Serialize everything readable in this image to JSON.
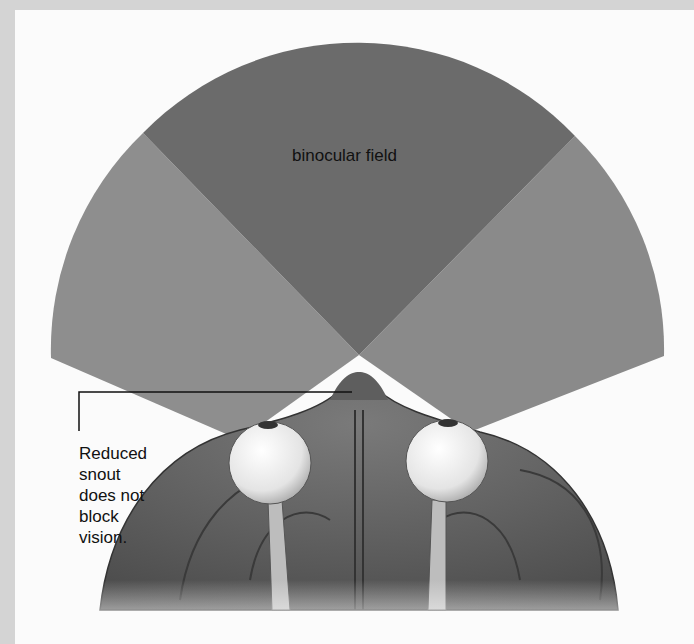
{
  "figure": {
    "binocular_label": "binocular field",
    "callout_lines": [
      "Reduced",
      "snout",
      "does not",
      "block",
      "vision."
    ],
    "colors": {
      "background_border": "#d4d4d4",
      "panel": "#fbfbfb",
      "binocular_field": "#6b6b6b",
      "monocular_field": "#8e8e8e",
      "head": "#5c5c5c",
      "eye": "#eeeeee"
    }
  }
}
